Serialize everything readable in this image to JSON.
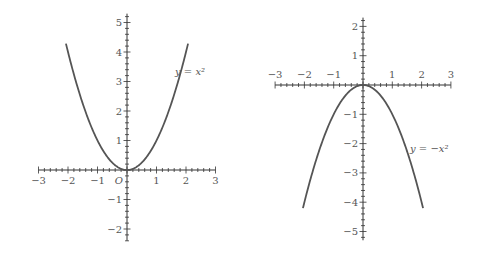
{
  "chart_data": [
    {
      "type": "line",
      "title": "",
      "function": "y = x^2",
      "label": "y = x²",
      "xlabel": "",
      "ylabel": "",
      "origin_label": "O",
      "xlim": [
        -3,
        3
      ],
      "ylim": [
        -2.4,
        5.3
      ],
      "xticks": [
        -3,
        -2,
        -1,
        1,
        2,
        3
      ],
      "xtick_labels": [
        "−3",
        "−2",
        "−1",
        "1",
        "2",
        "3"
      ],
      "yticks": [
        -2,
        -1,
        1,
        2,
        3,
        4,
        5
      ],
      "ytick_labels": [
        "−2",
        "−1",
        "1",
        "2",
        "3",
        "4",
        "5"
      ],
      "minor_ticks_per_unit": 5,
      "grid": false,
      "domain": [
        -2.07,
        2.07
      ],
      "series": [
        {
          "name": "y = x²",
          "x": [
            -2,
            -1.5,
            -1,
            -0.5,
            0,
            0.5,
            1,
            1.5,
            2
          ],
          "y": [
            4,
            2.25,
            1,
            0.25,
            0,
            0.25,
            1,
            2.25,
            4
          ]
        }
      ],
      "color": "#555555"
    },
    {
      "type": "line",
      "title": "",
      "function": "y = -x^2",
      "label": "y = −x²",
      "xlabel": "",
      "ylabel": "",
      "xlim": [
        -3,
        3
      ],
      "ylim": [
        -5.3,
        2.3
      ],
      "xticks": [
        -3,
        -2,
        -1,
        1,
        2,
        3
      ],
      "xtick_labels": [
        "−3",
        "−2",
        "−1",
        "1",
        "2",
        "3"
      ],
      "yticks": [
        -5,
        -4,
        -3,
        -2,
        -1,
        1,
        2
      ],
      "ytick_labels": [
        "−5",
        "−4",
        "−3",
        "−2",
        "−1",
        "1",
        "2"
      ],
      "minor_ticks_per_unit": 5,
      "grid": false,
      "domain": [
        -2.05,
        2.05
      ],
      "series": [
        {
          "name": "y = −x²",
          "x": [
            -2,
            -1.5,
            -1,
            -0.5,
            0,
            0.5,
            1,
            1.5,
            2
          ],
          "y": [
            -4,
            -2.25,
            -1,
            -0.25,
            0,
            -0.25,
            -1,
            -2.25,
            -4
          ]
        }
      ],
      "color": "#555555"
    }
  ],
  "plots": [
    {
      "origin_px": [
        127,
        170
      ],
      "unit_px": 29.5,
      "axis_x_range": [
        -3,
        3
      ],
      "axis_y_range": [
        -2.4,
        5.3
      ],
      "label_pos": [
        175,
        75
      ]
    },
    {
      "origin_px": [
        363,
        85
      ],
      "unit_px": 29.3,
      "axis_x_range": [
        -3,
        3
      ],
      "axis_y_range": [
        -5.3,
        2.3
      ],
      "label_pos": [
        410,
        152
      ]
    }
  ]
}
